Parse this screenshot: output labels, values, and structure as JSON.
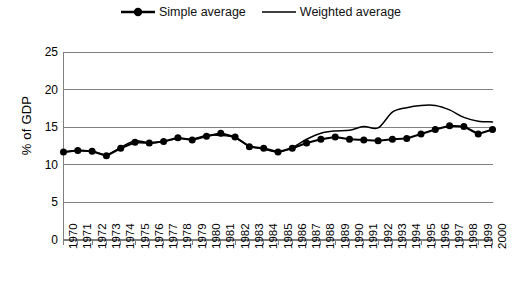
{
  "chart_data": {
    "type": "line",
    "title": "",
    "subtitle": "",
    "xlabel": "",
    "ylabel": "% of GDP",
    "ylim": [
      0,
      25
    ],
    "yticks": [
      0,
      5,
      10,
      15,
      20,
      25
    ],
    "grid": true,
    "legend_position": "top-center",
    "categories": [
      "1970",
      "1971",
      "1972",
      "1973",
      "1974",
      "1975",
      "1976",
      "1977",
      "1978",
      "1979",
      "1980",
      "1981",
      "1982",
      "1983",
      "1984",
      "1985",
      "1986",
      "1987",
      "1988",
      "1989",
      "1990",
      "1991",
      "1992",
      "1993",
      "1994",
      "1995",
      "1996",
      "1997",
      "1998",
      "1999",
      "2000"
    ],
    "series": [
      {
        "name": "Simple average",
        "marker": "diamond",
        "color": "#000000",
        "values": [
          11.7,
          11.9,
          11.8,
          11.2,
          12.2,
          13.0,
          12.9,
          13.1,
          13.6,
          13.3,
          13.8,
          14.2,
          13.7,
          12.4,
          12.2,
          11.7,
          12.2,
          12.9,
          13.4,
          13.7,
          13.4,
          13.3,
          13.2,
          13.4,
          13.5,
          14.1,
          14.7,
          15.2,
          15.1,
          14.1,
          14.7
        ]
      },
      {
        "name": "Weighted average",
        "marker": "none",
        "color": "#000000",
        "values": [
          11.7,
          11.9,
          11.8,
          11.3,
          12.3,
          13.2,
          12.9,
          13.1,
          13.5,
          13.4,
          13.9,
          13.9,
          13.6,
          12.5,
          12.1,
          11.7,
          12.3,
          13.4,
          14.2,
          14.5,
          14.6,
          15.1,
          14.9,
          17.0,
          17.6,
          17.9,
          17.9,
          17.3,
          16.3,
          15.8,
          15.7
        ]
      }
    ]
  },
  "legend": {
    "items": [
      {
        "label": "Simple average",
        "marker": "line-with-diamond-marker"
      },
      {
        "label": "Weighted average",
        "marker": "plain-line"
      }
    ]
  },
  "axes": {
    "y_title": "% of GDP",
    "y_tick_labels": [
      "25",
      "20",
      "15",
      "10",
      "5",
      "0"
    ],
    "x_tick_labels": [
      "1970",
      "1971",
      "1972",
      "1973",
      "1974",
      "1975",
      "1976",
      "1977",
      "1978",
      "1979",
      "1980",
      "1981",
      "1982",
      "1983",
      "1984",
      "1985",
      "1986",
      "1987",
      "1988",
      "1989",
      "1990",
      "1991",
      "1992",
      "1993",
      "1994",
      "1995",
      "1996",
      "1997",
      "1998",
      "1999",
      "2000"
    ]
  },
  "colors": {
    "ink": "#000000",
    "grid": "#808080",
    "background": "#ffffff"
  }
}
